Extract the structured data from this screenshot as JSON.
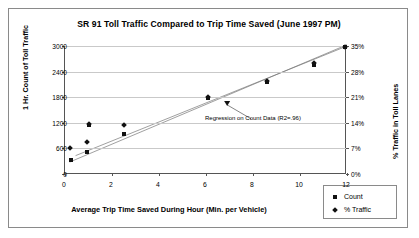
{
  "chart_data": {
    "type": "scatter",
    "title": "SR 91 Toll Traffic Compared to Trip Time Saved (June 1997 PM)",
    "xlabel": "Average Trip Time Saved During Hour (Min. per Vehicle)",
    "ylabel": "1 Hr. Count of Toll Traffic",
    "y2label": "% Traffic in Toll Lanes",
    "xlim": [
      0,
      12
    ],
    "ylim": [
      0,
      3000
    ],
    "y2lim": [
      0,
      35
    ],
    "xticks": [
      "0",
      "2",
      "4",
      "6",
      "8",
      "10",
      "12"
    ],
    "xtick_values": [
      0,
      2,
      4,
      6,
      8,
      10,
      12
    ],
    "yticks": [
      "0",
      "600",
      "1200",
      "1800",
      "2400",
      "3000"
    ],
    "ytick_values": [
      0,
      600,
      1200,
      1800,
      2400,
      3000
    ],
    "y2ticks": [
      "0%",
      "7%",
      "14%",
      "21%",
      "28%",
      "35%"
    ],
    "y2tick_values": [
      0,
      7,
      14,
      21,
      28,
      35
    ],
    "grid": true,
    "legend_position": "bottom-right",
    "series": [
      {
        "name": "Count",
        "marker": "square",
        "axis": "left",
        "points": [
          {
            "x": 0.25,
            "y": 330
          },
          {
            "x": 0.95,
            "y": 520
          },
          {
            "x": 1.0,
            "y": 1150
          },
          {
            "x": 2.5,
            "y": 930
          },
          {
            "x": 6.1,
            "y": 1780
          },
          {
            "x": 8.6,
            "y": 2150
          },
          {
            "x": 10.6,
            "y": 2560
          },
          {
            "x": 11.9,
            "y": 2980
          }
        ]
      },
      {
        "name": "% Traffic",
        "marker": "diamond",
        "axis": "right",
        "points": [
          {
            "x": 0.2,
            "y": 7.0
          },
          {
            "x": 0.95,
            "y": 8.8
          },
          {
            "x": 1.0,
            "y": 13.6
          },
          {
            "x": 2.5,
            "y": 13.3
          },
          {
            "x": 6.1,
            "y": 21.0
          },
          {
            "x": 8.6,
            "y": 25.3
          },
          {
            "x": 10.6,
            "y": 30.3
          },
          {
            "x": 11.9,
            "y": 34.8
          }
        ]
      }
    ],
    "trendlines": [
      {
        "name": "regression-count",
        "x0": 0.45,
        "y0": 430,
        "x1": 12.0,
        "y1": 3000
      },
      {
        "name": "regression-percent",
        "x0": 0.2,
        "y0": 280,
        "x1": 12.0,
        "y1": 3030
      }
    ],
    "annotation": {
      "text": "Regression on Count Data (R2=.96)",
      "arrow_from_x": 6.9,
      "arrow_from_y": 1620
    },
    "legend": [
      {
        "label": "Count",
        "marker": "square"
      },
      {
        "label": "% Traffic",
        "marker": "diamond"
      }
    ],
    "colors": {
      "marker": "#111111",
      "grid": "#c9c9c9",
      "axis": "#555555",
      "border": "#8a8a8a"
    }
  }
}
